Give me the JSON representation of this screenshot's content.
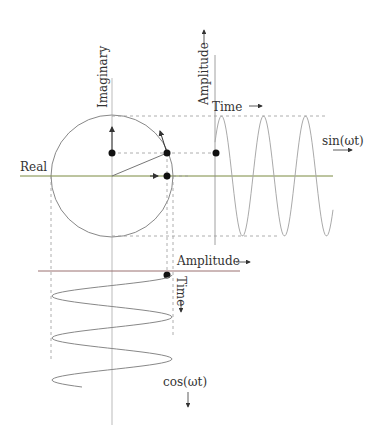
{
  "diagram": {
    "labels": {
      "imaginary": "Imaginary",
      "real": "Real",
      "amplitude_top": "Amplitude",
      "time_top": "Time",
      "sin": "sin(ωt)",
      "amplitude_bottom": "Amplitude",
      "time_bottom": "Time",
      "cos": "cos(ωt)"
    },
    "colors": {
      "circle": "#888888",
      "axis": "#999999",
      "real_axis": "#6b8e23",
      "dashed": "#aaaaaa",
      "wave": "#aaaaaa",
      "point": "#111111",
      "amp_axis_bottom": "#c04040"
    },
    "geometry": {
      "circle_center": [
        112,
        176
      ],
      "circle_radius": 61,
      "sine_axis_x": 215,
      "sine_baseline_y": 176,
      "sine_period_px": 42,
      "cosine_axis_y": 271,
      "cosine_period_px": 42
    }
  }
}
